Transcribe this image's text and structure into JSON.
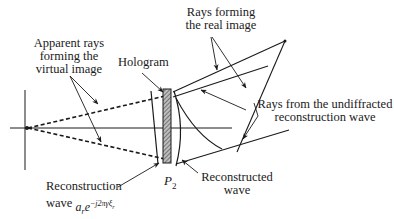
{
  "diagram": {
    "labels": {
      "apparent_rays": [
        "Apparent rays",
        "forming the",
        "virtual image"
      ],
      "hologram": "Hologram",
      "real_image_rays": [
        "Rays forming",
        "the real image"
      ],
      "undiffracted_rays": [
        "Rays from the undiffracted",
        "reconstruction wave"
      ],
      "reconstruction_wave": [
        "Reconstruction",
        "wave"
      ],
      "reconstruction_formula": {
        "base": "a",
        "base_sub": "r",
        "exp_base": "e",
        "exponent": "−j2πγ",
        "exponent_var": "ξ",
        "exponent_sub": "r"
      },
      "plane": {
        "symbol": "P",
        "subscript": "2"
      },
      "reconstructed_wave": [
        "Reconstructed",
        "wave"
      ]
    },
    "colors": {
      "line": "#1a1a1a",
      "hatch": "#555555",
      "background": "#ffffff"
    }
  }
}
